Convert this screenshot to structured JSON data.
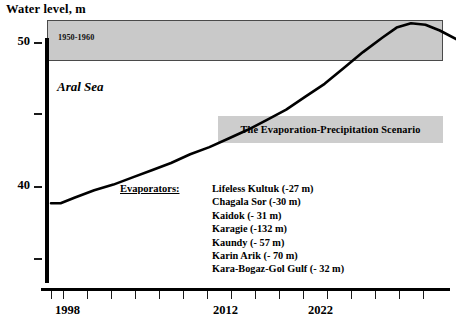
{
  "chart_data": {
    "type": "line",
    "title": "Water level, m",
    "xlabel": "",
    "ylabel": "Water level, m",
    "ylim": [
      35,
      52
    ],
    "xlim": [
      1996,
      2029
    ],
    "grid": false,
    "legend_position": "none",
    "y_ticks": [
      {
        "value": 50,
        "label": "50"
      },
      {
        "value": 45,
        "label": ""
      },
      {
        "value": 40,
        "label": "40"
      },
      {
        "value": 35,
        "label": ""
      }
    ],
    "x_ticks": [
      1997,
      1998,
      1999,
      2000,
      2001,
      2002,
      2003,
      2004,
      2005,
      2006,
      2007,
      2008,
      2009,
      2010,
      2011,
      2012,
      2013,
      2014,
      2015,
      2016,
      2017,
      2018,
      2019,
      2020,
      2021,
      2022,
      2023,
      2024,
      2025,
      2026,
      2027,
      2028
    ],
    "x_tick_labels": [
      {
        "value": 1998,
        "label": "1998"
      },
      {
        "value": 2012,
        "label": "2012"
      },
      {
        "value": 2022,
        "label": "2022"
      }
    ],
    "series": [
      {
        "name": "Aral Sea water level",
        "x": [
          1998,
          1998.4,
          1999,
          1999.8,
          2000.6,
          2001.4,
          2002.2,
          2003,
          2003.8,
          2004.6,
          2005.4,
          2006.2,
          2007,
          2007.8,
          2008.6,
          2009.4,
          2010.2,
          2011,
          2011.8,
          2012.4,
          2013,
          2013.6,
          2014.2,
          2015,
          2015.8,
          2016.6,
          2017.4,
          2018.2,
          2019,
          2019.8,
          2020.6,
          2021.4,
          2022.2,
          2023,
          2023.8,
          2024.6,
          2025.4,
          2026.2,
          2027,
          2027.8,
          2028.6
        ],
        "y": [
          38.8,
          38.8,
          39.2,
          39.7,
          40.1,
          40.6,
          41.1,
          41.6,
          42.2,
          42.7,
          43.3,
          43.9,
          44.6,
          45.3,
          46.2,
          47.1,
          48.2,
          49.3,
          50.3,
          51.0,
          51.3,
          51.2,
          50.8,
          50.1,
          49.4,
          49.2,
          49.6,
          50.1,
          50.4,
          50.3,
          50.1,
          50.3,
          50.5,
          50.2,
          49.5,
          49.2,
          49.6,
          50.3,
          50.6,
          50.6,
          50.6
        ]
      }
    ],
    "annotations": [
      {
        "name": "historical-band",
        "label": "1950-1960",
        "type": "shaded-band",
        "y_range": [
          49.5,
          52.2
        ],
        "color": "#c9c9c9"
      },
      {
        "name": "series-label",
        "label": "Aral Sea"
      },
      {
        "name": "scenario-box",
        "label": "The Evaporation-Precipitation Scenario",
        "color": "#cdcdcd"
      }
    ]
  },
  "chart": {
    "title": "Water level, m",
    "band_label": "1950-1960",
    "series_label": "Aral Sea",
    "scenario_label": "The Evaporation-Precipitation Scenario",
    "evaporators_title": "Evaporators:",
    "evaporators": [
      "Lifeless Kultuk (-27 m)",
      "Chagala Sor (-30 m)",
      "Kaidok (- 31 m)",
      "Karagie (-132 m)",
      "Kaundy (- 57 m)",
      "Karin Arik (- 70 m)",
      "Kara-Bogaz-Gol Gulf (- 32 m)"
    ],
    "y_labels": [
      "50",
      "40"
    ],
    "x_labels": [
      "1998",
      "2012",
      "2022"
    ],
    "colors": {
      "band": "#c9c9c9",
      "scenario_box": "#cdcdcd",
      "curve": "#000000",
      "axis": "#000000"
    }
  }
}
